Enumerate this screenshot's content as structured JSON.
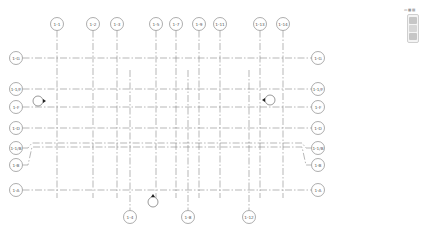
{
  "view": {
    "background": "#ffffff",
    "line_color": "#6e6e6e",
    "bubble_color": "#8a8a8a"
  },
  "grids": {
    "vertical_top": [
      {
        "label": "1-1",
        "x": 57
      },
      {
        "label": "1-2",
        "x": 93
      },
      {
        "label": "1-3",
        "x": 117
      },
      {
        "label": "1-5",
        "x": 156
      },
      {
        "label": "1-7",
        "x": 176
      },
      {
        "label": "1-9",
        "x": 199
      },
      {
        "label": "1-11",
        "x": 220
      },
      {
        "label": "1-13",
        "x": 260
      },
      {
        "label": "1-14",
        "x": 283
      }
    ],
    "vertical_bottom": [
      {
        "label": "1-4",
        "x": 130
      },
      {
        "label": "1-8",
        "x": 188
      },
      {
        "label": "1-12",
        "x": 249
      }
    ],
    "horizontal": [
      {
        "label": "1-G",
        "y": 58
      },
      {
        "label": "1-1/F",
        "y": 89
      },
      {
        "label": "1-F",
        "y": 107
      },
      {
        "label": "1-D",
        "y": 128
      },
      {
        "label": "1-1/B",
        "y": 148
      },
      {
        "label": "1-B",
        "y": 165
      },
      {
        "label": "1-A",
        "y": 190
      }
    ]
  },
  "markers": [
    {
      "name": "elevation-marker-left",
      "x": 38,
      "y": 101,
      "arrow": "right"
    },
    {
      "name": "elevation-marker-right",
      "x": 270,
      "y": 100,
      "arrow": "left"
    },
    {
      "name": "elevation-marker-bottom",
      "x": 153,
      "y": 202,
      "arrow": "up"
    }
  ],
  "navbar": {
    "top_label": "▭ ▦ ▤",
    "buttons": [
      "steering-wheel",
      "pan",
      "zoom"
    ]
  }
}
